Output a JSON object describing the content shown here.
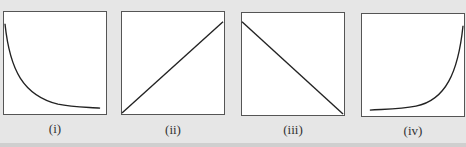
{
  "figure": {
    "background": "#e6e6e6",
    "line_color": "#222222",
    "panels": [
      {
        "id": "i",
        "label": "(i)",
        "curve": "decreasing-exponential"
      },
      {
        "id": "ii",
        "label": "(ii)",
        "curve": "increasing-linear"
      },
      {
        "id": "iii",
        "label": "(iii)",
        "curve": "decreasing-linear"
      },
      {
        "id": "iv",
        "label": "(iv)",
        "curve": "increasing-exponential"
      }
    ]
  }
}
